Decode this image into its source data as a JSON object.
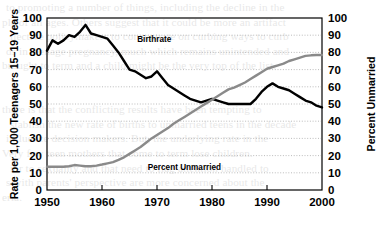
{
  "figure": {
    "background_color": "#ffffff",
    "ink_color": "#000000",
    "secondary_line_color": "#8a8a8a",
    "gridline_color": "#b4b4b4"
  },
  "background_text": {
    "note": "faint bleed-through text from the reverse side of the printed page",
    "lines": [
      "to promoting a number of things, including the decline in the",
      "ple of all ages. Others suggest that it could be more an artifact",
      "llective policymakers to concentrate on curbing ways to curb",
      "ds in teenage pregnancy, much which remains unintended and",
      "brought to term and a child might be the very top of the list.",
      "",
      "",
      "there is that the conflicting results have been tempting to",
      "stablish the new rate of births to unmarried teens in the decade",
      "influence decision makers. But, the underlying rate in the",
      "Very few teen mothers that come to term lose children.",
      "ior to sexuality and that need to flag attention handled to",
      "s with parents' perspective are more concerned about the",
      "eria."
    ]
  },
  "chart_data": {
    "type": "line",
    "title": "",
    "xlabel": "",
    "ylabel": "Rate per 1,000 Teenagers 15–19 Years",
    "y2label": "Percent Unmarried",
    "xlim": [
      1950,
      2000
    ],
    "ylim": [
      0,
      100
    ],
    "y2lim": [
      0,
      100
    ],
    "xticks": [
      1950,
      1960,
      1970,
      1980,
      1990,
      2000
    ],
    "yticks": [
      0,
      10,
      20,
      30,
      40,
      50,
      60,
      70,
      80,
      90,
      100
    ],
    "y2ticks": [
      0,
      10,
      20,
      30,
      40,
      50,
      60,
      70,
      80,
      90,
      100
    ],
    "grid": "horizontal-dotted",
    "legend": "inline-annotations",
    "series": [
      {
        "name": "Birthrate",
        "axis": "left",
        "color": "#000000",
        "line_width": 2.4,
        "label_position": {
          "x": 1969.5,
          "y": 86
        },
        "x": [
          1950,
          1951,
          1952,
          1953,
          1954,
          1955,
          1956,
          1957,
          1958,
          1959,
          1960,
          1961,
          1962,
          1963,
          1964,
          1965,
          1966,
          1967,
          1968,
          1969,
          1970,
          1971,
          1972,
          1973,
          1974,
          1975,
          1976,
          1977,
          1978,
          1979,
          1980,
          1981,
          1982,
          1983,
          1984,
          1985,
          1986,
          1987,
          1988,
          1989,
          1990,
          1991,
          1992,
          1993,
          1994,
          1995,
          1996,
          1997,
          1998,
          1999,
          2000
        ],
        "values": [
          81.0,
          87.0,
          85.0,
          87.0,
          90.0,
          89.0,
          92.0,
          96.0,
          91.0,
          90.0,
          89.0,
          88.0,
          84.0,
          80.0,
          75.0,
          70.0,
          69.0,
          67.0,
          65.0,
          66.0,
          69.0,
          65.0,
          61.0,
          59.0,
          57.0,
          55.0,
          53.0,
          52.0,
          51.0,
          52.0,
          53.0,
          52.0,
          51.0,
          50.0,
          50.0,
          50.0,
          50.0,
          50.0,
          53.0,
          57.0,
          60.0,
          62.0,
          60.0,
          59.0,
          58.0,
          56.0,
          54.0,
          52.0,
          51.0,
          49.0,
          48.0
        ]
      },
      {
        "name": "Percent Unmarried",
        "axis": "right",
        "color": "#8a8a8a",
        "line_width": 2.4,
        "label_position": {
          "x": 1975.0,
          "y": 11.5
        },
        "x": [
          1950,
          1951,
          1952,
          1953,
          1954,
          1955,
          1956,
          1957,
          1958,
          1959,
          1960,
          1961,
          1962,
          1963,
          1964,
          1965,
          1966,
          1967,
          1968,
          1969,
          1970,
          1971,
          1972,
          1973,
          1974,
          1975,
          1976,
          1977,
          1978,
          1979,
          1980,
          1981,
          1982,
          1983,
          1984,
          1985,
          1986,
          1987,
          1988,
          1989,
          1990,
          1991,
          1992,
          1993,
          1994,
          1995,
          1996,
          1997,
          1998,
          1999,
          2000
        ],
        "values": [
          13.5,
          13.5,
          13.5,
          13.5,
          13.8,
          14.5,
          14.2,
          13.8,
          13.8,
          14.2,
          14.8,
          15.5,
          16.2,
          17.5,
          19.0,
          21.0,
          23.0,
          25.0,
          27.5,
          30.0,
          32.0,
          34.0,
          36.0,
          38.5,
          40.5,
          42.5,
          44.5,
          46.5,
          48.5,
          50.5,
          52.5,
          54.5,
          56.5,
          58.5,
          59.5,
          61.0,
          62.5,
          64.5,
          66.5,
          68.5,
          70.5,
          71.5,
          72.5,
          73.5,
          75.0,
          76.0,
          77.0,
          78.0,
          78.3,
          78.5,
          78.5
        ]
      }
    ]
  }
}
